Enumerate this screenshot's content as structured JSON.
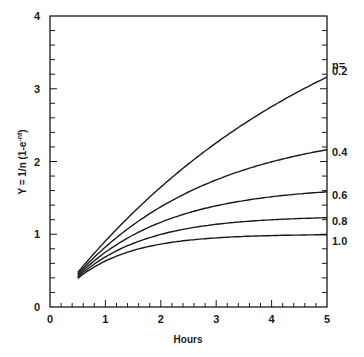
{
  "chart_data": {
    "type": "line",
    "title": "",
    "xlabel": "Hours",
    "ylabel": "Y = 1/n (1-e^-nt)",
    "ylabel_main": "Y = 1/n (1-e",
    "ylabel_sup": "-nt",
    "ylabel_tail": ")",
    "xlim": [
      0,
      5
    ],
    "ylim": [
      0,
      4
    ],
    "xticks": [
      "0",
      "1",
      "2",
      "3",
      "4",
      "5"
    ],
    "yticks": [
      "0",
      "1",
      "2",
      "3",
      "4"
    ],
    "minor_tick_step": 0.2,
    "grid": false,
    "legend_title": "n=",
    "legend_position": "right-inline",
    "x": [
      0.5,
      1.0,
      1.5,
      2.0,
      2.5,
      3.0,
      3.5,
      4.0,
      4.5,
      5.0
    ],
    "series": [
      {
        "name": "0.2",
        "values": [
          0.48,
          0.91,
          1.3,
          1.65,
          1.97,
          2.26,
          2.52,
          2.75,
          2.97,
          3.16
        ]
      },
      {
        "name": "0.4",
        "values": [
          0.45,
          0.82,
          1.12,
          1.38,
          1.58,
          1.74,
          1.88,
          1.99,
          2.08,
          2.16
        ]
      },
      {
        "name": "0.6",
        "values": [
          0.43,
          0.75,
          0.99,
          1.16,
          1.29,
          1.39,
          1.46,
          1.51,
          1.54,
          1.58
        ]
      },
      {
        "name": "0.8",
        "values": [
          0.41,
          0.69,
          0.87,
          1.0,
          1.08,
          1.14,
          1.17,
          1.2,
          1.22,
          1.23
        ]
      },
      {
        "name": "1.0",
        "values": [
          0.39,
          0.63,
          0.78,
          0.86,
          0.92,
          0.95,
          0.97,
          0.98,
          0.99,
          0.99
        ]
      }
    ],
    "formula": "Y = (1/n)(1 - e^(-n t))"
  }
}
